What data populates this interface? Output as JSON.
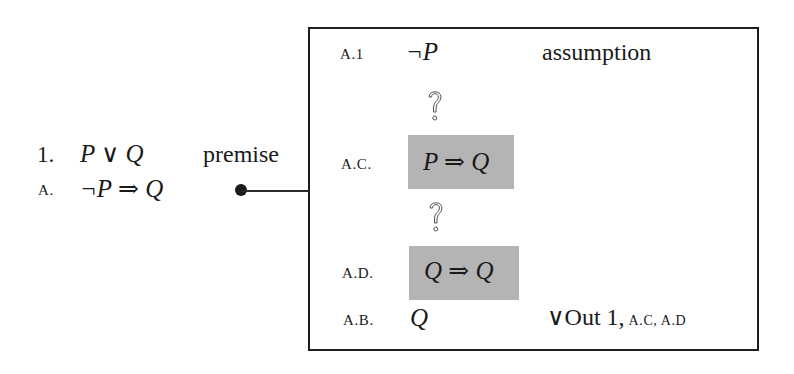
{
  "outer_proof": {
    "lines": [
      {
        "label": "1.",
        "formula": "P ∨ Q",
        "justification": "premise"
      },
      {
        "label": "a.",
        "formula": "¬P ⇒ Q",
        "justification": ""
      }
    ],
    "connector": {
      "from": "line-a-justification-dot",
      "to": "subproof-box"
    }
  },
  "subproof": {
    "lines": [
      {
        "label": "a.1",
        "formula": "¬P",
        "justification": "assumption",
        "highlighted": false
      },
      {
        "label": "",
        "formula": "?",
        "justification": "",
        "type": "unknown-gap"
      },
      {
        "label": "a.c.",
        "formula": "P ⇒ Q",
        "justification": "",
        "highlighted": true
      },
      {
        "label": "",
        "formula": "?",
        "justification": "",
        "type": "unknown-gap"
      },
      {
        "label": "a.d.",
        "formula": "Q ⇒ Q",
        "justification": "",
        "highlighted": true
      },
      {
        "label": "a.b.",
        "formula": "Q",
        "justification": "∨Out  1,",
        "justification_refs": "a.c, a.d",
        "highlighted": false
      }
    ]
  },
  "colors": {
    "highlight": "#b4b4b4",
    "ink": "#1a1a1a",
    "border": "#1e1e1e"
  }
}
